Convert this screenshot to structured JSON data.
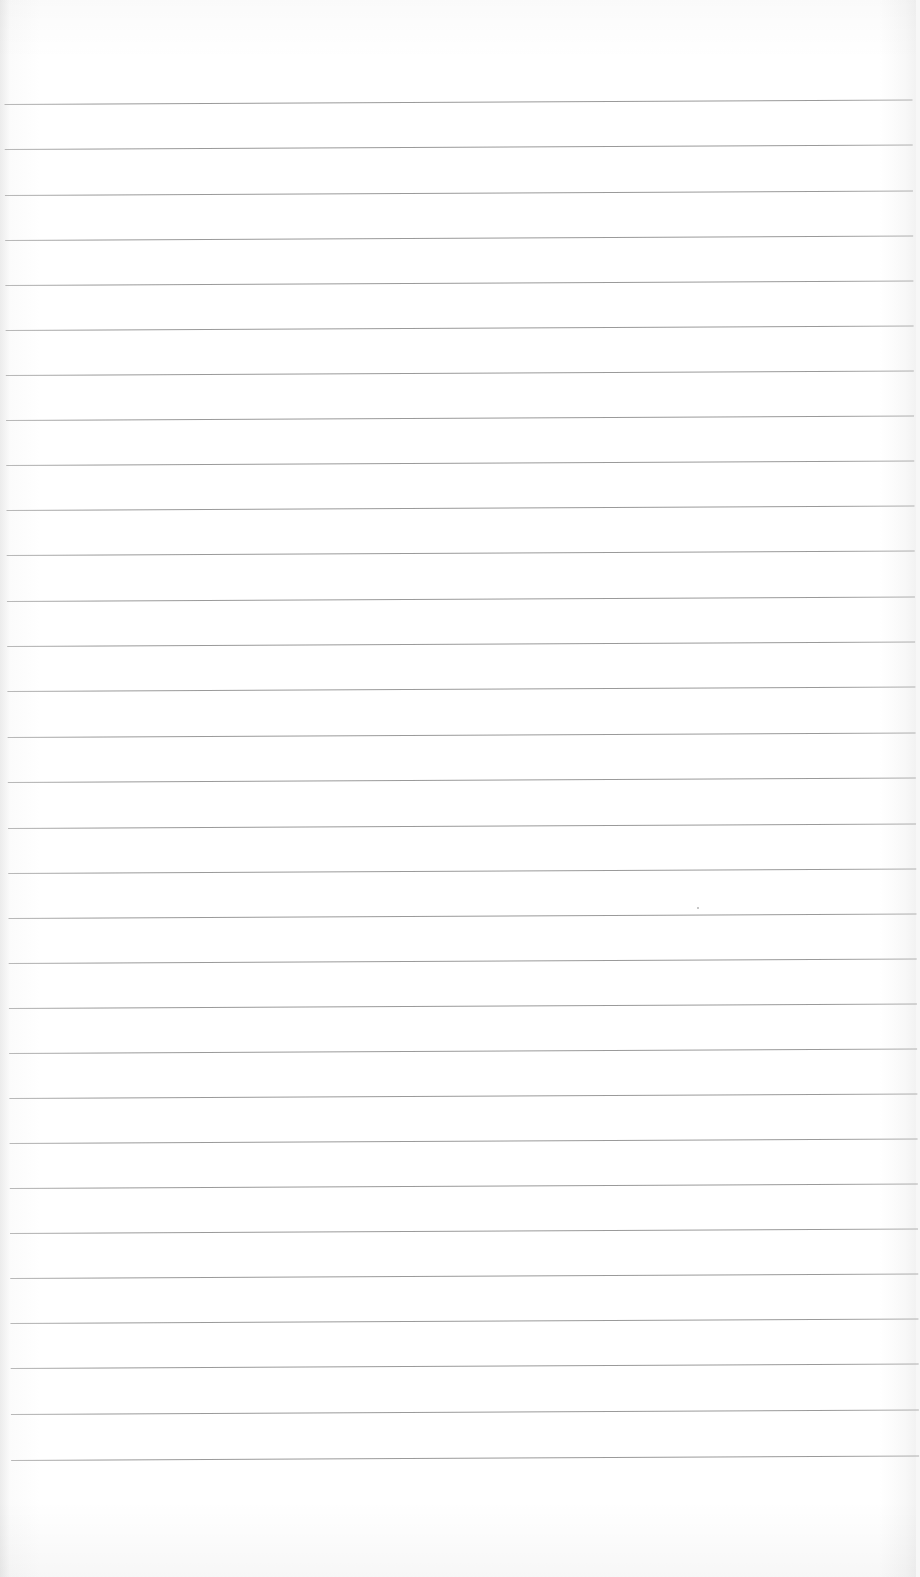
{
  "image": {
    "subject": "Blank lined notebook paper",
    "background_color": "#ffffff",
    "rule_color": "#9a9a9a",
    "rule_count": 31,
    "first_rule_y": 104,
    "rule_spacing": 45.2,
    "rules": [
      104,
      149,
      195,
      240,
      285,
      330,
      375,
      420,
      465,
      510,
      555,
      601,
      646,
      691,
      737,
      782,
      828,
      873,
      918,
      963,
      1008,
      1053,
      1098,
      1143,
      1188,
      1233,
      1278,
      1323,
      1368,
      1414,
      1460
    ],
    "specks": [
      {
        "x": 697,
        "y": 907
      }
    ]
  }
}
